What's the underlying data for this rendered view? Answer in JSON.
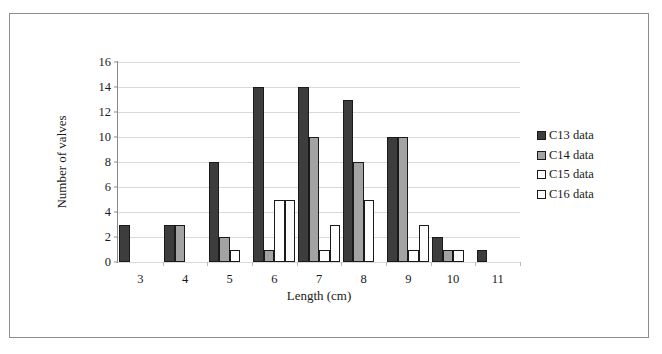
{
  "chart_data": {
    "type": "bar",
    "title": "",
    "xlabel": "Length (cm)",
    "ylabel": "Number of valves",
    "categories": [
      "3",
      "4",
      "5",
      "6",
      "7",
      "8",
      "9",
      "10",
      "11"
    ],
    "series": [
      {
        "name": "C13 data",
        "color": "#3d3d3d",
        "border": "#1a1a1a",
        "values": [
          3,
          3,
          8,
          14,
          14,
          13,
          10,
          2,
          1
        ]
      },
      {
        "name": "C14 data",
        "color": "#a3a3a3",
        "border": "#1a1a1a",
        "values": [
          0,
          3,
          2,
          1,
          10,
          8,
          10,
          1,
          0
        ]
      },
      {
        "name": "C15 data",
        "color": "#ffffff",
        "border": "#1a1a1a",
        "values": [
          0,
          0,
          1,
          5,
          1,
          5,
          1,
          1,
          0
        ]
      },
      {
        "name": "C16 data",
        "color": "#fcfcfc",
        "border": "#1a1a1a",
        "values": [
          0,
          0,
          0,
          5,
          3,
          0,
          3,
          0,
          0
        ]
      }
    ],
    "ylim": [
      0,
      16
    ],
    "yticks": [
      0,
      2,
      4,
      6,
      8,
      10,
      12,
      14,
      16
    ],
    "grid": true,
    "legend_position": "right"
  }
}
